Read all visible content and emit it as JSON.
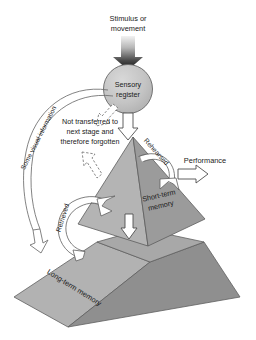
{
  "diagram": {
    "background_color": "#ffffff",
    "nodes": {
      "stimulus": {
        "label_line1": "Stimulus or",
        "label_line2": "movement",
        "icon": "gradient-down-arrow"
      },
      "sensory_register": {
        "label_line1": "Sensory",
        "label_line2": "register",
        "shape": "circle",
        "fill": "#c3c3c3"
      },
      "short_term_memory": {
        "label_line1": "Short-term",
        "label_line2": "memory",
        "shape": "pyramid",
        "fill_left": "#b0b0b0",
        "fill_right": "#9a9a9a"
      },
      "long_term_memory": {
        "label": "Long-term memory",
        "shape": "truncated-pyramid",
        "fill_left": "#adadad",
        "fill_right": "#939393",
        "fill_top": "#a5a5a5"
      }
    },
    "annotations": {
      "not_transferred": {
        "line1": "Not transferred to",
        "line2": "next stage and",
        "line3": "therefore forgotten"
      },
      "some_visual_information": "Some visual information",
      "rehearsed": "Rehearsed",
      "retrieved": "Retrieved",
      "performance": "Performance"
    },
    "arrows": [
      {
        "name": "stimulus-to-sensory",
        "style": "gradient-filled",
        "direction": "down"
      },
      {
        "name": "sensory-to-forgotten",
        "style": "dashed-hollow",
        "direction": "down-left"
      },
      {
        "name": "sensory-to-stm",
        "style": "hollow",
        "direction": "down"
      },
      {
        "name": "stm-to-forgotten",
        "style": "dashed-hollow",
        "direction": "up-left"
      },
      {
        "name": "rehearsed-loop",
        "style": "solid-white-curve",
        "direction": "clockwise"
      },
      {
        "name": "stm-to-performance",
        "style": "hollow",
        "direction": "right"
      },
      {
        "name": "stm-to-ltm",
        "style": "hollow",
        "direction": "down"
      },
      {
        "name": "retrieved-loop",
        "style": "solid-white-curve",
        "direction": "up-right"
      },
      {
        "name": "some-visual-information-curve",
        "style": "hollow-thin-curve",
        "direction": "down"
      }
    ]
  }
}
